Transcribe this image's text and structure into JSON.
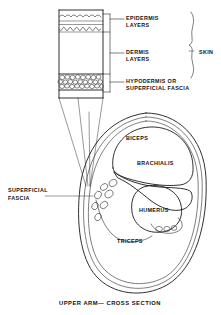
{
  "figure": {
    "caption": "UPPER ARM— CROSS SECTION",
    "background_color": "#ffffff",
    "ink_color": "#1a1a1a"
  },
  "skin_detail": {
    "bracket_label": "SKIN",
    "layers": [
      {
        "id": "epidermis",
        "label_line1": "EPIDERMIS",
        "label_line2": "LAYERS"
      },
      {
        "id": "dermis",
        "label_line1": "DERMIS",
        "label_line2": "LAYERS"
      },
      {
        "id": "hypodermis",
        "label_line1": "HYPODERMIS OR",
        "label_line2": "SUPERFICIAL FASCIA"
      }
    ]
  },
  "cross_section": {
    "labels": [
      {
        "id": "biceps",
        "text": "BICEPS"
      },
      {
        "id": "brachialis",
        "text": "BRACHIALIS"
      },
      {
        "id": "humerus",
        "text": "HUMERUS"
      },
      {
        "id": "triceps",
        "text": "TRICEPS"
      }
    ],
    "callout": {
      "id": "superficial-fascia",
      "line1": "SUPERFICIAL",
      "line2": "FASCIA"
    }
  }
}
